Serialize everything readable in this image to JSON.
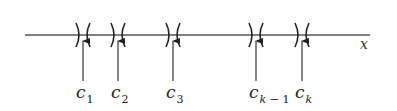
{
  "diagram": {
    "axis": {
      "label": "x",
      "x_start": 25,
      "x_end": 370,
      "y": 35,
      "color": "#555555"
    },
    "points": [
      {
        "name": "c1",
        "base": "c",
        "sub": "1",
        "x": 83
      },
      {
        "name": "c2",
        "base": "c",
        "sub": "2",
        "x": 118
      },
      {
        "name": "c3",
        "base": "c",
        "sub": "3",
        "x": 173
      },
      {
        "name": "ck-1",
        "base": "c",
        "sub": "k − 1",
        "x": 256
      },
      {
        "name": "ck",
        "base": "c",
        "sub": "k",
        "x": 302
      }
    ],
    "stroke_color": "#222222"
  }
}
